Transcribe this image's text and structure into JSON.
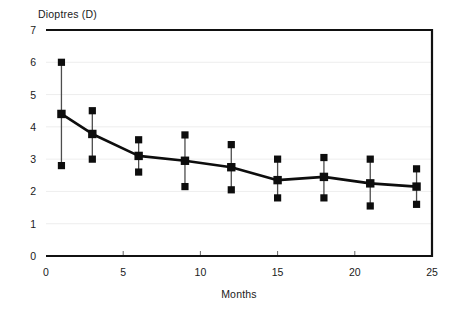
{
  "chart_data": {
    "type": "line",
    "title": "",
    "xlabel": "Months",
    "ylabel": "Dioptres (D)",
    "xlim": [
      0,
      25
    ],
    "ylim": [
      0,
      7
    ],
    "xticks": [
      0,
      5,
      10,
      15,
      20,
      25
    ],
    "yticks": [
      0,
      1,
      2,
      3,
      4,
      5,
      6,
      7
    ],
    "xtick_labels": [
      "0",
      "5",
      "10",
      "15",
      "20",
      "25"
    ],
    "ytick_labels": [
      "0",
      "1",
      "2",
      "3",
      "4",
      "5",
      "6",
      "7"
    ],
    "grid": "horizontal",
    "legend": "none",
    "marker": "square",
    "error_bars": "vertical-with-square-caps",
    "x": [
      1,
      3,
      6,
      9,
      12,
      15,
      18,
      21,
      24
    ],
    "values": [
      4.4,
      3.78,
      3.1,
      2.95,
      2.75,
      2.35,
      2.45,
      2.25,
      2.15
    ],
    "upper": [
      6.0,
      4.5,
      3.6,
      3.75,
      3.45,
      3.0,
      3.05,
      3.0,
      2.7
    ],
    "lower": [
      2.8,
      3.0,
      2.6,
      2.15,
      2.05,
      1.8,
      1.8,
      1.55,
      1.6
    ],
    "series": [
      {
        "name": "Dioptres",
        "points": [
          {
            "month": 1,
            "mean": 4.4,
            "upper": 6.0,
            "lower": 2.8
          },
          {
            "month": 3,
            "mean": 3.78,
            "upper": 4.5,
            "lower": 3.0
          },
          {
            "month": 6,
            "mean": 3.1,
            "upper": 3.6,
            "lower": 2.6
          },
          {
            "month": 9,
            "mean": 2.95,
            "upper": 3.75,
            "lower": 2.15
          },
          {
            "month": 12,
            "mean": 2.75,
            "upper": 3.45,
            "lower": 2.05
          },
          {
            "month": 15,
            "mean": 2.35,
            "upper": 3.0,
            "lower": 1.8
          },
          {
            "month": 18,
            "mean": 2.45,
            "upper": 3.05,
            "lower": 1.8
          },
          {
            "month": 21,
            "mean": 2.25,
            "upper": 3.0,
            "lower": 1.55
          },
          {
            "month": 24,
            "mean": 2.15,
            "upper": 2.7,
            "lower": 1.6
          }
        ]
      }
    ],
    "colors": {
      "line": "#0d0d0d",
      "marker": "#0d0d0d",
      "error_bar": "#4d4d4d",
      "frame": "#111111",
      "grid": "#e8e8e8",
      "background": "#ffffff",
      "text": "#1a1a1a"
    }
  }
}
